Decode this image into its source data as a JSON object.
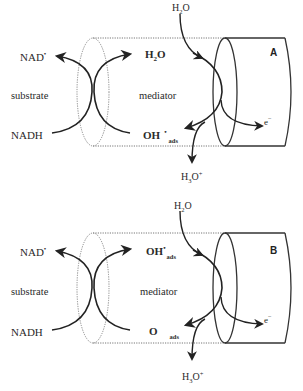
{
  "figure": {
    "panels": [
      {
        "id": "A",
        "letter": "A",
        "left_labels": {
          "top": "NAD",
          "top_sup": "•",
          "middle": "substrate",
          "bottom": "NADH"
        },
        "inner_labels": {
          "top": "H",
          "top_sub": "2",
          "top_tail": "O",
          "middle": "mediator",
          "bottom": "OH",
          "bottom_sup": "•",
          "bottom_sub": "ads"
        },
        "input": {
          "base": "H",
          "sub": "2",
          "tail": "O"
        },
        "output": {
          "base": "H",
          "sub": "3",
          "tail": "O",
          "sup": "+"
        },
        "electron": {
          "base": "e",
          "sup": "−"
        }
      },
      {
        "id": "B",
        "letter": "B",
        "left_labels": {
          "top": "NAD",
          "top_sup": "•",
          "middle": "substrate",
          "bottom": "NADH"
        },
        "inner_labels": {
          "top": "OH",
          "top_sup": "•",
          "top_sub": "ads",
          "middle": "mediator",
          "bottom": "O",
          "bottom_sub": "ads"
        },
        "input": {
          "base": "H",
          "sub": "2",
          "tail": "O"
        },
        "output": {
          "base": "H",
          "sub": "3",
          "tail": "O",
          "sup": "+"
        },
        "electron": {
          "base": "e",
          "sup": "−"
        }
      }
    ]
  }
}
